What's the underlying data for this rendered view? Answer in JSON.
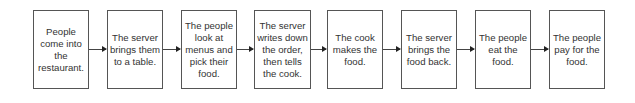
{
  "diagram": {
    "type": "linear-flowchart",
    "steps": [
      {
        "id": 1,
        "label": "People come into the restaurant."
      },
      {
        "id": 2,
        "label": "The server brings them to a table."
      },
      {
        "id": 3,
        "label": "The people look at menus and pick their food."
      },
      {
        "id": 4,
        "label": "The server writes down the order, then tells the cook."
      },
      {
        "id": 5,
        "label": "The cook makes the food."
      },
      {
        "id": 6,
        "label": "The server brings the food back."
      },
      {
        "id": 7,
        "label": "The people eat the food."
      },
      {
        "id": 8,
        "label": "The people pay for the food."
      }
    ],
    "connectors": [
      {
        "from": 1,
        "to": 2
      },
      {
        "from": 2,
        "to": 3
      },
      {
        "from": 3,
        "to": 4
      },
      {
        "from": 4,
        "to": 5
      },
      {
        "from": 5,
        "to": 6
      },
      {
        "from": 6,
        "to": 7
      },
      {
        "from": 7,
        "to": 8
      }
    ],
    "colors": {
      "border": "#555555",
      "text": "#333333",
      "arrow": "#333333",
      "background": "#ffffff"
    }
  }
}
